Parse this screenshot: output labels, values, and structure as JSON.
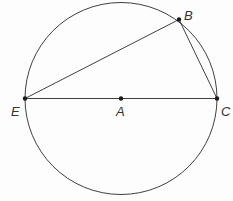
{
  "figure": {
    "type": "circle-geometry"
  },
  "points": {
    "A": {
      "label": "A",
      "role": "center"
    },
    "B": {
      "label": "B",
      "role": "on-circle"
    },
    "C": {
      "label": "C",
      "role": "diameter-endpoint"
    },
    "E": {
      "label": "E",
      "role": "diameter-endpoint"
    }
  },
  "segments": [
    {
      "name": "EC",
      "from": "E",
      "to": "C",
      "note": "diameter through A"
    },
    {
      "name": "EB",
      "from": "E",
      "to": "B"
    },
    {
      "name": "BC",
      "from": "B",
      "to": "C"
    }
  ],
  "colors": {
    "stroke": "#2a2a2a",
    "point": "#1a1a1a",
    "label": "#333333",
    "background": "#ffffff"
  }
}
